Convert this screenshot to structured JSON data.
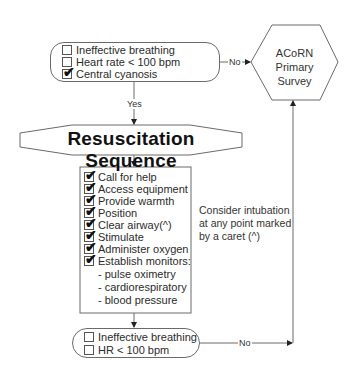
{
  "top_box": {
    "items": [
      {
        "label": "Ineffective breathing",
        "checked": false
      },
      {
        "label": "Heart rate < 100 bpm",
        "checked": false
      },
      {
        "label": "Central cyanosis",
        "checked": true
      }
    ]
  },
  "connectors": {
    "top_no": "No",
    "yes": "Yes",
    "bottom_no": "No"
  },
  "hexagon": {
    "line1": "ACoRN",
    "line2": "Primary",
    "line3": "Survey"
  },
  "title": "Resuscitation Sequence",
  "checklist": {
    "items": [
      {
        "label": "Call for help",
        "checked": true
      },
      {
        "label": "Access equipment",
        "checked": true
      },
      {
        "label": "Provide warmth",
        "checked": true
      },
      {
        "label": "Position",
        "checked": true
      },
      {
        "label": "Clear airway(^)",
        "checked": true
      },
      {
        "label": "Stimulate",
        "checked": true
      },
      {
        "label": "Administer oxygen",
        "checked": true
      },
      {
        "label": "Establish monitors:",
        "checked": true
      }
    ],
    "sub_items": [
      "- pulse oximetry",
      "- cardiorespiratory",
      "- blood pressure"
    ]
  },
  "note": {
    "line1": "Consider intubation",
    "line2": "at any point marked",
    "line3": "by a caret (^)"
  },
  "bottom_box": {
    "items": [
      {
        "label": "Ineffective breathing",
        "checked": false
      },
      {
        "label": "HR < 100 bpm",
        "checked": false
      }
    ]
  },
  "colors": {
    "line": "#6a6a6a",
    "text": "#2b2b2b",
    "tick": "#111111"
  }
}
